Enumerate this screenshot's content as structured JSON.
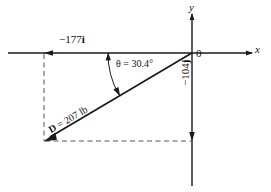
{
  "figure": {
    "name": "force-vector-resolution-diagram",
    "background_color": "#ffffff",
    "line_color": "#1a1a1a",
    "dashed_color": "#4a4a4a"
  },
  "axes": {
    "x_label": "x",
    "y_label": "y",
    "origin_label": "0"
  },
  "labels": {
    "x_component": "−177",
    "x_component_unit": "i",
    "y_component": "−104",
    "y_component_unit": "j",
    "angle": "θ = 30.4°",
    "angle_symbol": "θ",
    "angle_value": "30.4°",
    "magnitude_name": "D",
    "magnitude": " = 207 lb",
    "magnitude_value": "207",
    "magnitude_units": "lb"
  },
  "geometry": {
    "origin": [
      192,
      53
    ],
    "vector_tip": [
      44,
      141
    ],
    "angle_degrees": 30.4,
    "x_component_value": -177,
    "y_component_value": -104,
    "magnitude_value": 207,
    "x_axis_extent": [
      8,
      252
    ],
    "y_axis_extent": [
      14,
      186
    ]
  }
}
